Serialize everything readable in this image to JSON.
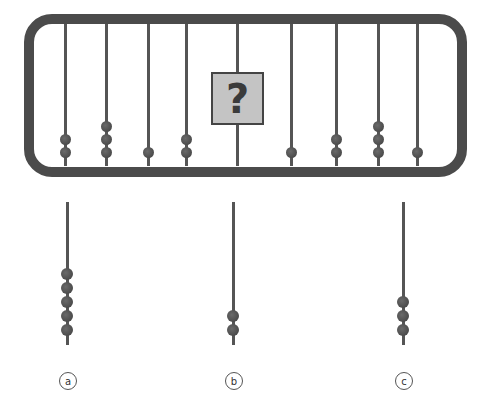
{
  "puzzle": {
    "type": "abacus-sequence",
    "frame_color": "#4b4b4b",
    "bead_color": "#4a4a4a",
    "rods": [
      {
        "x": 65,
        "beads": 2
      },
      {
        "x": 106,
        "beads": 3
      },
      {
        "x": 148,
        "beads": 1
      },
      {
        "x": 186,
        "beads": 2
      },
      {
        "x": 237,
        "beads": null,
        "unknown": true
      },
      {
        "x": 291,
        "beads": 1
      },
      {
        "x": 336,
        "beads": 2
      },
      {
        "x": 378,
        "beads": 3
      },
      {
        "x": 417,
        "beads": 1
      }
    ],
    "question_mark": "?"
  },
  "options": [
    {
      "label": "a",
      "x": 67,
      "beads": 5
    },
    {
      "label": "b",
      "x": 233,
      "beads": 2
    },
    {
      "label": "c",
      "x": 403,
      "beads": 3
    }
  ]
}
